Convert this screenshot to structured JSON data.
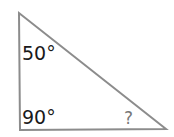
{
  "diagram": {
    "type": "right-triangle",
    "stroke_color": "#8c8c8c",
    "text_color": "#1a1a1a",
    "question_color": "#777777",
    "vertices": {
      "top": [
        19,
        13
      ],
      "bottom_left": [
        20,
        130
      ],
      "bottom_right": [
        166,
        129
      ]
    },
    "angles": {
      "top": "50°",
      "bottom_left": "90°",
      "bottom_right": "?"
    }
  }
}
